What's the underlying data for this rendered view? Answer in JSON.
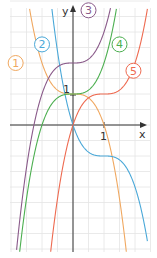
{
  "chart_data": {
    "type": "line",
    "title": "",
    "xlabel": "x",
    "ylabel": "y",
    "xlim": [
      -2.35,
      2.3
    ],
    "ylim": [
      -4.4,
      4.15
    ],
    "grid": true,
    "grid_step": 0.5,
    "tick_labels": {
      "x": [
        "1"
      ],
      "y": [
        "1"
      ]
    },
    "series": [
      {
        "name": "1",
        "formula": "y = 1 - x^3",
        "color": "#f0a860",
        "label_pos": [
          -1.85,
          2.0
        ]
      },
      {
        "name": "2",
        "formula": "y = -(x-1)^3 - 1 + 1",
        "color": "#4aa8d8",
        "label_pos": [
          -1.0,
          2.6
        ]
      },
      {
        "name": "3",
        "formula": "y = x^3 + 2",
        "color": "#8a5a8a",
        "label_pos": [
          0.5,
          3.7
        ]
      },
      {
        "name": "4",
        "formula": "y = x^3 + 1",
        "color": "#4caf50",
        "label_pos": [
          1.5,
          2.6
        ]
      },
      {
        "name": "5",
        "formula": "y = (x-1)^3 + 1",
        "color": "#ee6a50",
        "label_pos": [
          1.95,
          1.75
        ]
      }
    ]
  },
  "labels": {
    "x_axis": "x",
    "y_axis": "y",
    "x_one": "1",
    "y_one": "1"
  }
}
